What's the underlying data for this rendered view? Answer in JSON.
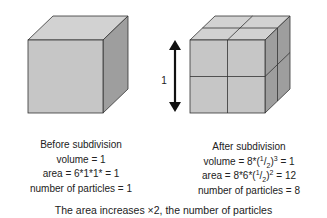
{
  "diagram": {
    "left_cube": {
      "label": "single cube"
    },
    "right_cube": {
      "label": "subdivided cube 2x2x2"
    },
    "arrow_label": "1",
    "colors": {
      "front": "#c6c6c6",
      "top": "#d2d2d2",
      "side": "#9e9e9e",
      "edge": "#333333",
      "arrow": "#111111"
    }
  },
  "before": {
    "title": "Before subdivision",
    "volume": "volume = 1",
    "area": "area = 6*1*1* = 1",
    "particles": "number of particles = 1"
  },
  "after": {
    "title": "After subdivision",
    "volume_prefix": "volume = 8*(",
    "volume_num": "1",
    "volume_slash": "/",
    "volume_den": "2",
    "volume_exp": "3",
    "volume_suffix": " = 1",
    "area_prefix": "area = 8*6*(",
    "area_num": "1",
    "area_slash": "/",
    "area_den": "2",
    "area_exp": "2",
    "area_suffix": " = 12",
    "particles": "number of particles = 8"
  },
  "footer": "The area increases ×2, the number of particles"
}
